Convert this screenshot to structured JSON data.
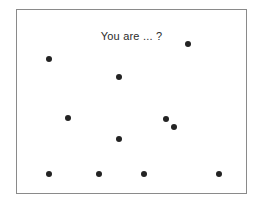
{
  "figure": {
    "caption": "You are ... ?",
    "background_color": "#ffffff",
    "border_color": "#8a8a8a",
    "dot_color": "#232323",
    "text_color": "#2b2b2b"
  },
  "chart_data": {
    "type": "scatter",
    "title": "You are ... ?",
    "xlabel": "",
    "ylabel": "",
    "grid": false,
    "legend": null,
    "xlim": [
      0,
      231
    ],
    "ylim": [
      0,
      185
    ],
    "point_count": 11,
    "point_diameter_px": 6,
    "points": [
      {
        "x": 171,
        "y": 34
      },
      {
        "x": 32,
        "y": 49
      },
      {
        "x": 102,
        "y": 67
      },
      {
        "x": 51,
        "y": 108
      },
      {
        "x": 149,
        "y": 109
      },
      {
        "x": 157,
        "y": 117
      },
      {
        "x": 102,
        "y": 129
      },
      {
        "x": 32,
        "y": 164
      },
      {
        "x": 82,
        "y": 164
      },
      {
        "x": 127,
        "y": 164
      },
      {
        "x": 202,
        "y": 164
      }
    ]
  }
}
